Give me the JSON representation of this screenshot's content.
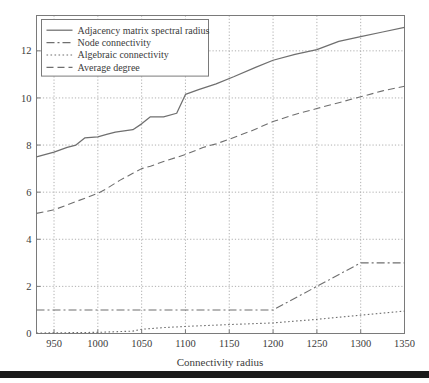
{
  "figure": {
    "background_color": "#ffffff",
    "frame_color": "#7a7a7a",
    "grid_color": "#9a9a9a",
    "line_color": "#6f6f6f",
    "text_color": "#3b3b3b",
    "bottom_bar_color": "#1a1a1a"
  },
  "chart_data": {
    "type": "line",
    "title": "",
    "xlabel": "Connectivity radius",
    "ylabel": "",
    "xlim": [
      930,
      1350
    ],
    "ylim": [
      0,
      13.5
    ],
    "xticks": [
      950,
      1000,
      1050,
      1100,
      1150,
      1200,
      1250,
      1300,
      1350
    ],
    "yticks": [
      0,
      2,
      4,
      6,
      8,
      10,
      12
    ],
    "xtick_labels": [
      "950",
      "1000",
      "1050",
      "1100",
      "1150",
      "1200",
      "1250",
      "1300",
      "1350"
    ],
    "ytick_labels": [
      "0",
      "2",
      "4",
      "6",
      "8",
      "10",
      "12"
    ],
    "grid": true,
    "grid_style": "dotted",
    "legend_position": "upper left",
    "series": [
      {
        "name": "Adjacency matrix spectral radius",
        "style": "solid",
        "dash": "none",
        "x": [
          930,
          950,
          965,
          975,
          985,
          1000,
          1010,
          1020,
          1030,
          1040,
          1050,
          1060,
          1075,
          1090,
          1100,
          1115,
          1135,
          1155,
          1180,
          1200,
          1225,
          1250,
          1275,
          1300,
          1325,
          1350
        ],
        "y": [
          7.5,
          7.7,
          7.9,
          8.0,
          8.3,
          8.35,
          8.45,
          8.55,
          8.6,
          8.65,
          8.9,
          9.2,
          9.2,
          9.35,
          10.15,
          10.35,
          10.6,
          10.9,
          11.3,
          11.6,
          11.85,
          12.05,
          12.4,
          12.6,
          12.8,
          13.0
        ]
      },
      {
        "name": "Node connectivity",
        "style": "dashdot",
        "dash": "8,3,2,3",
        "x": [
          930,
          1000,
          1100,
          1200,
          1250,
          1300,
          1350
        ],
        "y": [
          1,
          1,
          1,
          1,
          2,
          3,
          3
        ]
      },
      {
        "name": "Algebraic connectivity",
        "style": "dotted",
        "dash": "1.6,2.4",
        "x": [
          930,
          1000,
          1040,
          1050,
          1075,
          1100,
          1150,
          1200,
          1250,
          1300,
          1350
        ],
        "y": [
          0.02,
          0.05,
          0.1,
          0.18,
          0.25,
          0.3,
          0.38,
          0.45,
          0.6,
          0.78,
          0.95
        ]
      },
      {
        "name": "Average degree",
        "style": "dashed",
        "dash": "7,4",
        "x": [
          930,
          950,
          975,
          1000,
          1010,
          1025,
          1040,
          1050,
          1060,
          1075,
          1100,
          1120,
          1135,
          1150,
          1175,
          1200,
          1225,
          1250,
          1275,
          1300,
          1325,
          1350
        ],
        "y": [
          5.1,
          5.25,
          5.6,
          5.95,
          6.15,
          6.5,
          6.8,
          7.0,
          7.1,
          7.3,
          7.6,
          7.9,
          8.05,
          8.25,
          8.6,
          9.0,
          9.3,
          9.55,
          9.8,
          10.05,
          10.3,
          10.5
        ]
      }
    ]
  },
  "legend": {
    "entries": [
      {
        "label": "Adjacency matrix spectral radius",
        "style": "solid"
      },
      {
        "label": "Node connectivity",
        "style": "dashdot"
      },
      {
        "label": "Algebraic connectivity",
        "style": "dotted"
      },
      {
        "label": "Average degree",
        "style": "dashed"
      }
    ]
  }
}
